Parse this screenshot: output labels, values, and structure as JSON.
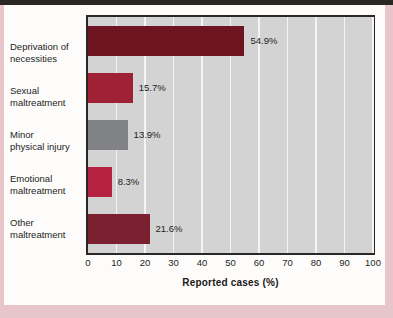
{
  "figure": {
    "card_background": "#fdfcfb",
    "border_color": "#e8c5c8",
    "plot_background": "#d3d3d3",
    "gridline_color": "#f4f4f4",
    "frame_color": "#2b2724"
  },
  "chart_data": {
    "type": "bar",
    "orientation": "horizontal",
    "title": "",
    "xlabel": "Reported cases (%)",
    "ylabel": "",
    "xlim": [
      0,
      100
    ],
    "xticks": [
      0,
      10,
      20,
      30,
      40,
      50,
      60,
      70,
      80,
      90,
      100
    ],
    "xtick_labels": [
      "0",
      "10",
      "20",
      "30",
      "40",
      "50",
      "60",
      "70",
      "80",
      "90",
      "100"
    ],
    "grid": "vertical-white-gridlines",
    "legend": "none",
    "categories": [
      "Deprivation of necessities",
      "Sexual maltreatment",
      "Minor physical injury",
      "Emotional maltreatment",
      "Other maltreatment"
    ],
    "category_lines": [
      [
        "Deprivation of",
        "necessities"
      ],
      [
        "Sexual",
        "maltreatment"
      ],
      [
        "Minor",
        "physical injury"
      ],
      [
        "Emotional",
        "maltreatment"
      ],
      [
        "Other",
        "maltreatment"
      ]
    ],
    "values": [
      54.9,
      15.7,
      13.9,
      8.3,
      21.6
    ],
    "data_labels": [
      "54.9%",
      "15.7%",
      "13.9%",
      "8.3%",
      "21.6%"
    ],
    "bar_colors": [
      "#6e1420",
      "#9e2233",
      "#808285",
      "#b52240",
      "#7a2030"
    ]
  }
}
